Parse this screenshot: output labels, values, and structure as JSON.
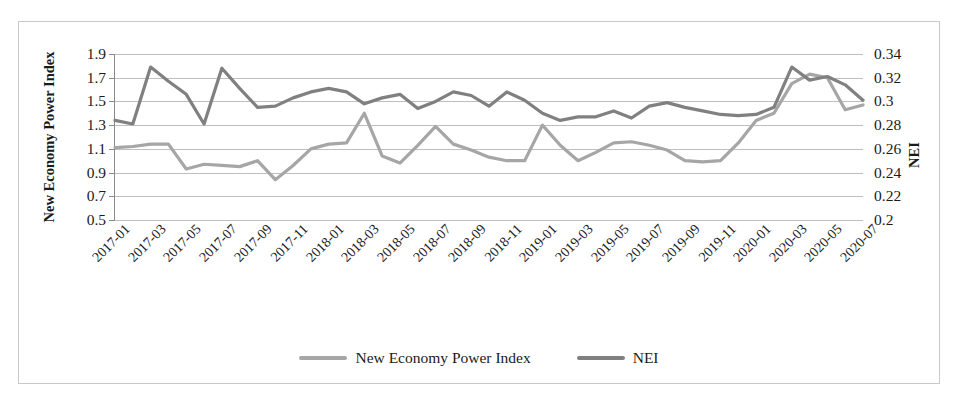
{
  "chart_data": {
    "type": "line",
    "title": "",
    "xlabel": "",
    "grid": true,
    "legend_position": "bottom",
    "x": [
      "2017-01",
      "2017-02",
      "2017-03",
      "2017-04",
      "2017-05",
      "2017-06",
      "2017-07",
      "2017-08",
      "2017-09",
      "2017-10",
      "2017-11",
      "2017-12",
      "2018-01",
      "2018-02",
      "2018-03",
      "2018-04",
      "2018-05",
      "2018-06",
      "2018-07",
      "2018-08",
      "2018-09",
      "2018-10",
      "2018-11",
      "2018-12",
      "2019-01",
      "2019-02",
      "2019-03",
      "2019-04",
      "2019-05",
      "2019-06",
      "2019-07",
      "2019-08",
      "2019-09",
      "2019-10",
      "2019-11",
      "2019-12",
      "2020-01",
      "2020-02",
      "2020-03",
      "2020-04",
      "2020-05",
      "2020-06",
      "2020-07"
    ],
    "x_tick_labels": [
      "2017-01",
      "2017-03",
      "2017-05",
      "2017-07",
      "2017-09",
      "2017-11",
      "2018-01",
      "2018-03",
      "2018-05",
      "2018-07",
      "2018-09",
      "2018-11",
      "2019-01",
      "2019-03",
      "2019-05",
      "2019-07",
      "2019-09",
      "2019-11",
      "2020-01",
      "2020-03",
      "2020-05",
      "2020-07"
    ],
    "series": [
      {
        "name": "New Economy Power Index",
        "axis": "left",
        "color": "#a6a6a6",
        "ylabel": "New Economy Power Index",
        "ylim": [
          0.5,
          1.9
        ],
        "ytick_labels": [
          "1.9",
          "1.7",
          "1.5",
          "1.3",
          "1.1",
          "0.9",
          "0.7",
          "0.5"
        ],
        "yticks": [
          1.9,
          1.7,
          1.5,
          1.3,
          1.1,
          0.9,
          0.7,
          0.5
        ],
        "values": [
          1.11,
          1.12,
          1.14,
          1.14,
          0.93,
          0.97,
          0.96,
          0.95,
          1.0,
          0.84,
          0.96,
          1.1,
          1.14,
          1.15,
          1.4,
          1.04,
          0.98,
          1.13,
          1.29,
          1.14,
          1.09,
          1.03,
          1.0,
          1.0,
          1.3,
          1.13,
          1.0,
          1.07,
          1.15,
          1.16,
          1.13,
          1.09,
          1.0,
          0.99,
          1.0,
          1.15,
          1.34,
          1.4,
          1.65,
          1.73,
          1.7,
          1.43,
          1.47
        ]
      },
      {
        "name": "NEI",
        "axis": "right",
        "color": "#808080",
        "ylabel": "NEI",
        "ylim": [
          0.2,
          0.34
        ],
        "ytick_labels": [
          "0.34",
          "0.32",
          "0.3",
          "0.28",
          "0.26",
          "0.24",
          "0.22",
          "0.2"
        ],
        "yticks": [
          0.34,
          0.32,
          0.3,
          0.28,
          0.26,
          0.24,
          0.22,
          0.2
        ],
        "values": [
          0.284,
          0.281,
          0.329,
          0.317,
          0.306,
          0.281,
          0.328,
          0.311,
          0.295,
          0.296,
          0.303,
          0.308,
          0.311,
          0.308,
          0.298,
          0.303,
          0.306,
          0.294,
          0.3,
          0.308,
          0.305,
          0.296,
          0.308,
          0.301,
          0.29,
          0.284,
          0.287,
          0.287,
          0.292,
          0.286,
          0.296,
          0.299,
          0.295,
          0.292,
          0.289,
          0.288,
          0.289,
          0.295,
          0.329,
          0.318,
          0.321,
          0.314,
          0.301
        ]
      }
    ],
    "legend": [
      {
        "label": "New Economy Power Index",
        "color": "#a6a6a6"
      },
      {
        "label": "NEI",
        "color": "#808080"
      }
    ]
  }
}
